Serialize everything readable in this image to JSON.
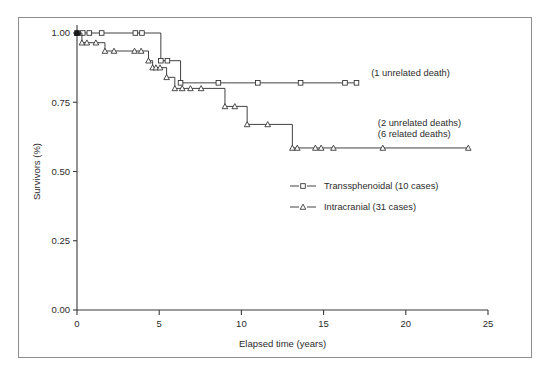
{
  "figure": {
    "border_color": "#8d8d8d",
    "background": "#ffffff"
  },
  "chart_data": {
    "type": "line",
    "title": "",
    "subtitle": "",
    "xlabel": "Elapsed time (years)",
    "ylabel": "Survivors (%)",
    "xlim": [
      0,
      25
    ],
    "ylim": [
      0.0,
      1.0
    ],
    "xticks": [
      0,
      5,
      10,
      15,
      20,
      25
    ],
    "xtick_labels": [
      "0",
      "5",
      "10",
      "15",
      "20",
      "25"
    ],
    "yticks": [
      0.0,
      0.25,
      0.5,
      0.75,
      1.0
    ],
    "ytick_labels": [
      "0.00",
      "0.25",
      "0.50",
      "0.75",
      "1.00"
    ],
    "grid": false,
    "legend_position": "center",
    "curve_style": "kaplan-meier-step",
    "series": [
      {
        "name": "Transsphenoidal (10 cases)",
        "marker": "square",
        "legend_label": "Transsphenoidal (10 cases)",
        "n_cases": 10,
        "end_annotation": "(1 unrelated death)",
        "points": [
          {
            "x": 0.0,
            "y": 1.0,
            "censored": false
          },
          {
            "x": 0.35,
            "y": 1.0,
            "censored": true
          },
          {
            "x": 0.75,
            "y": 1.0,
            "censored": true
          },
          {
            "x": 1.5,
            "y": 1.0,
            "censored": true
          },
          {
            "x": 3.55,
            "y": 1.0,
            "censored": true
          },
          {
            "x": 3.95,
            "y": 1.0,
            "censored": true
          },
          {
            "x": 5.1,
            "y": 0.9,
            "censored": true
          },
          {
            "x": 5.5,
            "y": 0.9,
            "censored": true
          },
          {
            "x": 6.3,
            "y": 0.82,
            "censored": true
          },
          {
            "x": 8.6,
            "y": 0.82,
            "censored": true
          },
          {
            "x": 11.0,
            "y": 0.82,
            "censored": true
          },
          {
            "x": 13.6,
            "y": 0.82,
            "censored": true
          },
          {
            "x": 16.3,
            "y": 0.82,
            "censored": true
          },
          {
            "x": 17.0,
            "y": 0.82,
            "censored": true
          }
        ]
      },
      {
        "name": "Intracranial (31 cases)",
        "marker": "triangle",
        "legend_label": "Intracranial (31 cases)",
        "n_cases": 31,
        "end_annotation_lines": [
          "(2 unrelated deaths)",
          "(6 related deaths)"
        ],
        "points": [
          {
            "x": 0.0,
            "y": 1.0,
            "censored": false
          },
          {
            "x": 0.3,
            "y": 0.965,
            "censored": true
          },
          {
            "x": 0.6,
            "y": 0.965,
            "censored": true
          },
          {
            "x": 1.15,
            "y": 0.965,
            "censored": true
          },
          {
            "x": 1.7,
            "y": 0.935,
            "censored": true
          },
          {
            "x": 2.25,
            "y": 0.935,
            "censored": true
          },
          {
            "x": 3.5,
            "y": 0.935,
            "censored": true
          },
          {
            "x": 3.9,
            "y": 0.935,
            "censored": true
          },
          {
            "x": 4.35,
            "y": 0.9,
            "censored": true
          },
          {
            "x": 4.6,
            "y": 0.875,
            "censored": true
          },
          {
            "x": 4.8,
            "y": 0.875,
            "censored": true
          },
          {
            "x": 5.05,
            "y": 0.875,
            "censored": true
          },
          {
            "x": 5.45,
            "y": 0.84,
            "censored": true
          },
          {
            "x": 5.95,
            "y": 0.8,
            "censored": true
          },
          {
            "x": 6.4,
            "y": 0.8,
            "censored": true
          },
          {
            "x": 6.9,
            "y": 0.8,
            "censored": true
          },
          {
            "x": 7.55,
            "y": 0.8,
            "censored": true
          },
          {
            "x": 9.0,
            "y": 0.735,
            "censored": true
          },
          {
            "x": 9.6,
            "y": 0.735,
            "censored": true
          },
          {
            "x": 10.35,
            "y": 0.67,
            "censored": true
          },
          {
            "x": 11.6,
            "y": 0.67,
            "censored": true
          },
          {
            "x": 13.1,
            "y": 0.585,
            "censored": true
          },
          {
            "x": 13.4,
            "y": 0.585,
            "censored": true
          },
          {
            "x": 14.5,
            "y": 0.585,
            "censored": true
          },
          {
            "x": 14.85,
            "y": 0.585,
            "censored": true
          },
          {
            "x": 15.6,
            "y": 0.585,
            "censored": true
          },
          {
            "x": 18.6,
            "y": 0.585,
            "censored": true
          },
          {
            "x": 23.8,
            "y": 0.585,
            "censored": true
          }
        ]
      }
    ],
    "annotations": [
      {
        "id": "transsphenoidal-end",
        "text": "(1 unrelated death)",
        "x": 17.9,
        "y": 0.845
      },
      {
        "id": "intracranial-end-1",
        "text": "(2 unrelated deaths)",
        "x": 18.3,
        "y": 0.665
      },
      {
        "id": "intracranial-end-2",
        "text": "(6 related deaths)",
        "x": 18.3,
        "y": 0.625
      }
    ],
    "legend_entries": [
      {
        "label": "Transsphenoidal (10 cases)",
        "marker": "square"
      },
      {
        "label": "Intracranial (31 cases)",
        "marker": "triangle"
      }
    ]
  }
}
